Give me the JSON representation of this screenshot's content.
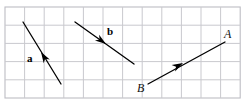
{
  "figure": {
    "name": "vector-grid-diagram",
    "background_color": "#ffffff",
    "grid": {
      "line_color": "#c9c9ce",
      "border_color": "#bdbdc4",
      "x0": 5,
      "y0": 7,
      "cell_width": 19.6,
      "cell_height": 18.2,
      "cols": 12,
      "rows": 5
    },
    "vectors": [
      {
        "id": "vector-a",
        "label": "a",
        "label_style": "bold",
        "label_x": 27,
        "label_y": 53,
        "color": "#000000",
        "stroke_width": 1.3,
        "tail_x": 61,
        "tail_y": 84,
        "tip_x": 23,
        "tip_y": 22,
        "head_at_x": 41,
        "head_at_y": 52,
        "head_mid_line": true,
        "direction": "up-left"
      },
      {
        "id": "vector-b",
        "label": "b",
        "label_style": "bold",
        "label_x": 107,
        "label_y": 26,
        "color": "#000000",
        "stroke_width": 1.3,
        "tail_x": 75,
        "tail_y": 22,
        "tip_x": 134,
        "tip_y": 64,
        "head_at_x": 106,
        "head_at_y": 44,
        "head_mid_line": true,
        "direction": "down-right"
      },
      {
        "id": "vector-ab",
        "label": "",
        "label_style": "italic",
        "color": "#000000",
        "stroke_width": 1.3,
        "tail_x": 148,
        "tail_y": 84,
        "tip_x": 225,
        "tip_y": 42,
        "head_at_x": 183,
        "head_at_y": 63,
        "head_mid_line": true,
        "direction": "down-left"
      }
    ],
    "point_labels": [
      {
        "id": "label-A",
        "text": "A",
        "x": 224,
        "y": 28,
        "style": "italic"
      },
      {
        "id": "label-B",
        "text": "B",
        "x": 137,
        "y": 82,
        "style": "italic"
      }
    ]
  },
  "chart_data": {
    "type": "diagram",
    "title": "",
    "grid_cells": {
      "cols": 12,
      "rows": 5
    },
    "items": [
      {
        "name": "a",
        "from": [
          61,
          84
        ],
        "to": [
          23,
          22
        ],
        "points": "up-left"
      },
      {
        "name": "b",
        "from": [
          75,
          22
        ],
        "to": [
          134,
          64
        ],
        "points": "down-right"
      },
      {
        "name": "AB",
        "from": [
          225,
          42
        ],
        "to": [
          148,
          84
        ],
        "points": "down-left",
        "endpoints": [
          "A",
          "B"
        ]
      }
    ]
  }
}
